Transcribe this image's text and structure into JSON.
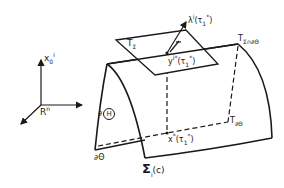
{
  "diagram": {
    "axes": {
      "vertical_label": "x",
      "vertical_sub": "0",
      "vertical_sup": "i",
      "space_label": "R",
      "space_sup": "n"
    },
    "labels": {
      "tangent_plane": "T",
      "tangent_plane_sub": "Σ",
      "tangent_intersection": "T",
      "tangent_intersection_sub": "Σ∩∂Θ",
      "lambda": "λ",
      "lambda_sup": "i",
      "lambda_arg": "(τ",
      "lambda_arg_sub": "1",
      "lambda_arg_sup": "*",
      "lambda_close": ")",
      "y_point": "y",
      "y_sup": "i*",
      "y_arg": "(τ",
      "y_arg_sub": "1",
      "y_arg_sup": "*",
      "y_close": ")",
      "x_point": "x",
      "x_sup": "*",
      "x_arg": "(τ",
      "x_arg_sub": "1",
      "x_arg_sup": "*",
      "x_close": ")",
      "boundary_h": "∂",
      "boundary_h_circled": "H",
      "boundary_theta": "∂Θ",
      "t_boundary": "T",
      "t_boundary_sub": "∂Θ",
      "sigma": "Σ",
      "sigma_sub": "i",
      "sigma_arg": "(c)"
    },
    "colors": {
      "ink": "#1a1a1a",
      "background": "#ffffff"
    }
  }
}
